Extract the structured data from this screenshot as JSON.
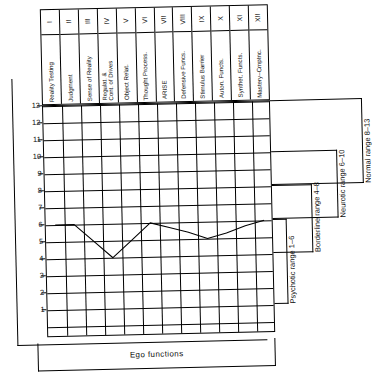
{
  "figure": {
    "x_axis_label": "Ego functions",
    "y_axis_ticks": [
      "13",
      "12",
      "11",
      "10",
      "9",
      "8",
      "7",
      "6",
      "5",
      "4",
      "3",
      "2",
      "1"
    ]
  },
  "columns": [
    {
      "numeral": "I",
      "name": "Reality Testing"
    },
    {
      "numeral": "II",
      "name": "Judgment"
    },
    {
      "numeral": "III",
      "name": "Sense of Reality"
    },
    {
      "numeral": "IV",
      "name": "Regulat. &\nCont. of Drives"
    },
    {
      "numeral": "V",
      "name": "Object Relat."
    },
    {
      "numeral": "VI",
      "name": "Thought Process."
    },
    {
      "numeral": "VII",
      "name": "ARISE"
    },
    {
      "numeral": "VIII",
      "name": "Defensive Funcs."
    },
    {
      "numeral": "IX",
      "name": "Stimulus Barrier"
    },
    {
      "numeral": "X",
      "name": "Auton. Functs."
    },
    {
      "numeral": "XI",
      "name": "Synthet. Functs."
    },
    {
      "numeral": "XII",
      "name": "Mastery–Cmptnc."
    }
  ],
  "ranges": [
    {
      "id": "normal",
      "label": "Normal range 8–13",
      "low": 8,
      "high": 13
    },
    {
      "id": "neurotic",
      "label": "Neurotic range 6–10",
      "low": 6,
      "high": 10
    },
    {
      "id": "borderline",
      "label": "Borderline range 4–8",
      "low": 4,
      "high": 8
    },
    {
      "id": "psychotic",
      "label": "Psychotic range 1–6",
      "low": 1,
      "high": 6
    }
  ],
  "chart_data": {
    "type": "line",
    "title": "",
    "xlabel": "Ego functions",
    "ylabel": "",
    "ylim": [
      0,
      13
    ],
    "grid": true,
    "categories": [
      "I",
      "II",
      "III",
      "IV",
      "V",
      "VI",
      "VII",
      "VIII",
      "IX",
      "X",
      "XI",
      "XII"
    ],
    "category_names": [
      "Reality Testing",
      "Judgment",
      "Sense of Reality",
      "Regulat. & Cont. of Drives",
      "Object Relat.",
      "Thought Process.",
      "ARISE",
      "Defensive Funcs.",
      "Stimulus Barrier",
      "Auton. Functs.",
      "Synthet. Functs.",
      "Mastery–Cmptnc."
    ],
    "values": [
      6,
      6,
      5,
      4,
      5,
      6,
      5.7,
      5.4,
      5,
      5.3,
      5.7,
      6
    ],
    "legend": [],
    "annotations": [
      "Normal range 8–13",
      "Neurotic range 6–10",
      "Borderline range 4–8",
      "Psychotic range 1–6"
    ]
  }
}
